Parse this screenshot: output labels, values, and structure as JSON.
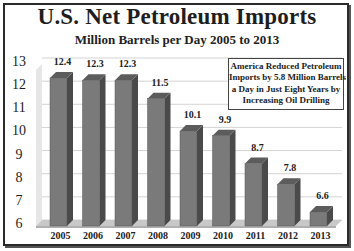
{
  "title": "U.S. Net Petroleum Imports",
  "subtitle": "Million Barrels per Day 2005 to 2013",
  "annotation": {
    "lines": [
      "America Reduced Petroleum",
      "Imports by 5.8 Million Barrels",
      "a Day in Just Eight Years by",
      "Increasing Oil Drilling"
    ]
  },
  "colors": {
    "bar_front": "#7a7a7a",
    "bar_side": "#4a4a4a",
    "bar_top": "#5c5c5c",
    "floor": "#c8c8c8",
    "back_wall": "#e6e6e6",
    "gridline": "#d4d4d4",
    "border": "#2a2a2a"
  },
  "chart_data": {
    "type": "bar",
    "style": "3d-column",
    "title": "U.S. Net Petroleum Imports",
    "subtitle": "Million Barrels per Day 2005 to 2013",
    "categories": [
      "2005",
      "2006",
      "2007",
      "2008",
      "2009",
      "2010",
      "2011",
      "2012",
      "2013"
    ],
    "values": [
      12.4,
      12.3,
      12.3,
      11.5,
      10.1,
      9.9,
      8.7,
      7.8,
      6.6
    ],
    "value_labels": [
      "12.4",
      "12.3",
      "12.3",
      "11.5",
      "10.1",
      "9.9",
      "8.7",
      "7.8",
      "6.6"
    ],
    "xlabel": "",
    "ylabel": "",
    "yticks": [
      "6",
      "7",
      "8",
      "9",
      "10",
      "11",
      "12",
      "13"
    ],
    "ylim": [
      6,
      13
    ],
    "grid": true,
    "legend": null,
    "annotation": "America Reduced Petroleum Imports by 5.8 Million Barrels a Day in Just Eight Years by Increasing Oil Drilling"
  }
}
